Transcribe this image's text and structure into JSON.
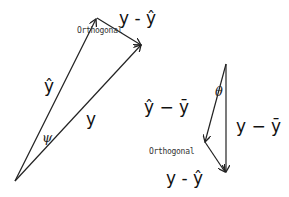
{
  "diagram": {
    "left_triangle": {
      "vectors": [
        {
          "name": "y-hat",
          "label": "ŷ"
        },
        {
          "name": "y",
          "label": "y"
        },
        {
          "name": "residual",
          "label": "y - ŷ"
        }
      ],
      "angle_label": "ψ",
      "annotation": "Orthogonal"
    },
    "right_triangle": {
      "vectors": [
        {
          "name": "y-hat-minus-y-bar",
          "label": "ŷ − ȳ"
        },
        {
          "name": "y-minus-y-bar",
          "label": "y − ȳ"
        },
        {
          "name": "residual",
          "label": "y - ŷ"
        }
      ],
      "angle_label": "θ",
      "annotation": "Orthogonal"
    },
    "colors": {
      "line": "#222222",
      "background": "#ffffff"
    }
  }
}
